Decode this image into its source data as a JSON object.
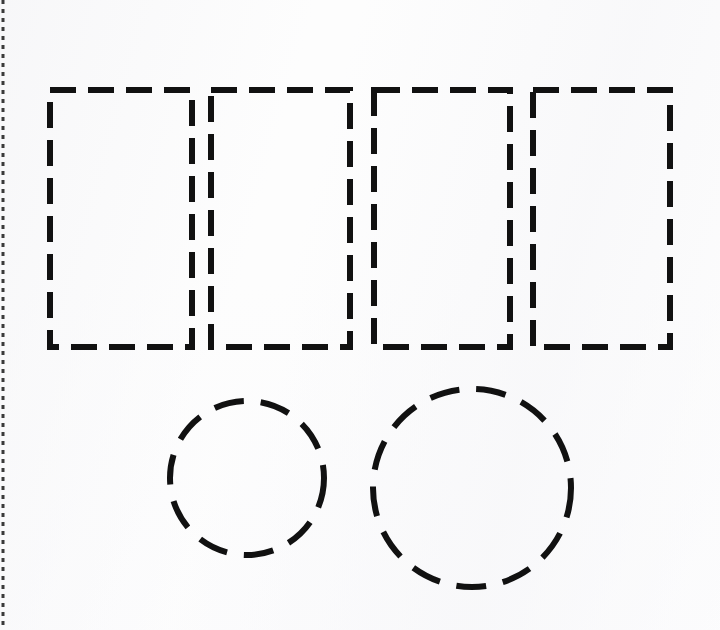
{
  "page": {
    "width": 720,
    "height": 630,
    "background_color": "#fdfdfd",
    "ink_color": "#111111",
    "margin_rule_color": "#3a3a3a"
  },
  "margin_rule": {
    "name": "left margin dotted rule",
    "orientation": "vertical",
    "x": 3,
    "y_start": 0,
    "y_end": 630,
    "stroke_width": 3,
    "dash": "4 5"
  },
  "shapes": {
    "group_label": "four adjoining dashed rectangles and two dashed circles",
    "stroke_width": 6,
    "rect_dash": "26 12",
    "circle_dash": "30 17",
    "rectangles": [
      {
        "name": "rectangle-1",
        "x": 50,
        "y": 90,
        "width": 142,
        "height": 257
      },
      {
        "name": "rectangle-2",
        "x": 211,
        "y": 90,
        "width": 139,
        "height": 257
      },
      {
        "name": "rectangle-3",
        "x": 374,
        "y": 90,
        "width": 136,
        "height": 257
      },
      {
        "name": "rectangle-4",
        "x": 533,
        "y": 90,
        "width": 137,
        "height": 257
      }
    ],
    "circles": [
      {
        "name": "circle-small",
        "cx": 247,
        "cy": 478,
        "r": 77
      },
      {
        "name": "circle-large",
        "cx": 472,
        "cy": 488,
        "r": 99
      }
    ]
  }
}
